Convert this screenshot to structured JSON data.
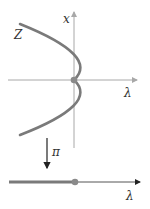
{
  "diagram": {
    "labels": {
      "curve": "Z",
      "vertical_axis": "x",
      "horizontal_axis_top": "λ",
      "projection": "π",
      "horizontal_axis_bottom": "λ"
    },
    "colors": {
      "curve": "#7a7a7a",
      "axis": "#a8a8a8",
      "arrow": "#222222",
      "point": "#8a8a8a",
      "background": "#ffffff"
    }
  }
}
